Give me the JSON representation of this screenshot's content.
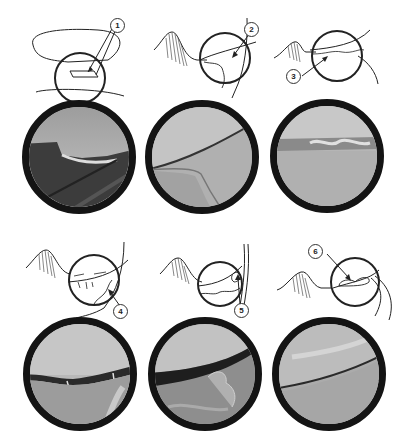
{
  "figure": {
    "panels": [
      {
        "id": 1,
        "label": "1",
        "description": "Horizontal flap tear schematic",
        "scope_tone": "dark flap over lower surface"
      },
      {
        "id": 2,
        "label": "2",
        "description": "Oblique/vertical tear schematic",
        "scope_tone": "smooth diagonal edge"
      },
      {
        "id": 3,
        "label": "3",
        "description": "Degenerative fraying schematic",
        "scope_tone": "frayed horizontal rim"
      },
      {
        "id": 4,
        "label": "4",
        "description": "Radial tear schematic",
        "scope_tone": "dark cleft with fibers"
      },
      {
        "id": 5,
        "label": "5",
        "description": "Complex tear schematic",
        "scope_tone": "irregular torn fragments"
      },
      {
        "id": 6,
        "label": "6",
        "description": "Displaced fragment schematic",
        "scope_tone": "smooth overlapping surfaces"
      }
    ],
    "colors": {
      "line": "#222222",
      "scope_ring": "#141414",
      "background": "#ffffff"
    }
  }
}
